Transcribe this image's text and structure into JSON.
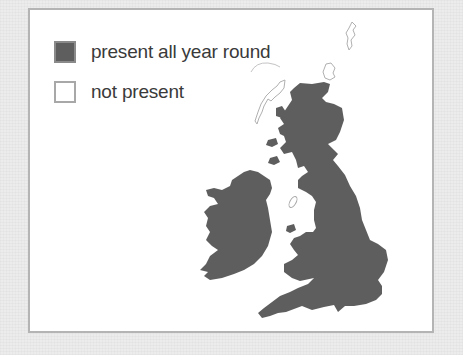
{
  "legend": {
    "items": [
      {
        "label": "present all year round",
        "color": "#5e5e5e",
        "style": "filled"
      },
      {
        "label": "not present",
        "color": "#ffffff",
        "style": "outline"
      }
    ]
  },
  "map": {
    "region": "Great Britain and Ireland",
    "fill_color": "#5e5e5e",
    "outline_islands": [
      "Shetland",
      "Orkney",
      "Outer Hebrides",
      "Isle of Man"
    ],
    "filled_regions": [
      "Scotland",
      "England",
      "Wales",
      "Ireland"
    ]
  }
}
